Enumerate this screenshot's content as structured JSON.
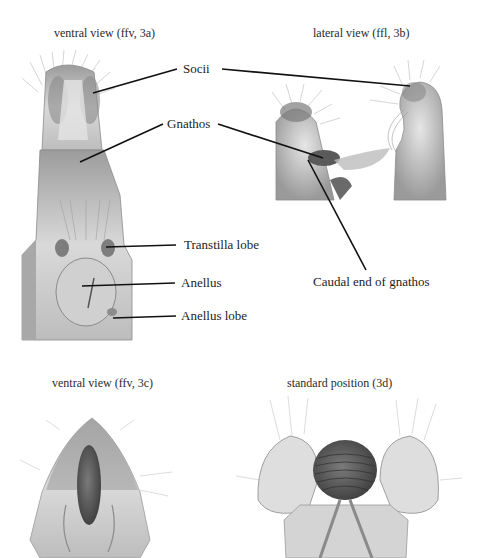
{
  "figure": {
    "panels": [
      {
        "id": "3a",
        "caption": "ventral view (ffv, 3a)"
      },
      {
        "id": "3b",
        "caption": "lateral view (ffl, 3b)"
      },
      {
        "id": "3c",
        "caption": "ventral view (ffv, 3c)"
      },
      {
        "id": "3d",
        "caption": "standard position (3d)"
      }
    ],
    "labels": {
      "socii": "Socii",
      "gnathos": "Gnathos",
      "transtilla_lobe": "Transtilla lobe",
      "anellus": "Anellus",
      "anellus_lobe": "Anellus lobe",
      "caudal_end": "Caudal end of gnathos"
    },
    "colors": {
      "background": "#ffffff",
      "leader_line": "#111111",
      "specimen_light": "#d8d8d8",
      "specimen_mid": "#a6a6a6",
      "specimen_dark": "#5e5e5e"
    }
  }
}
